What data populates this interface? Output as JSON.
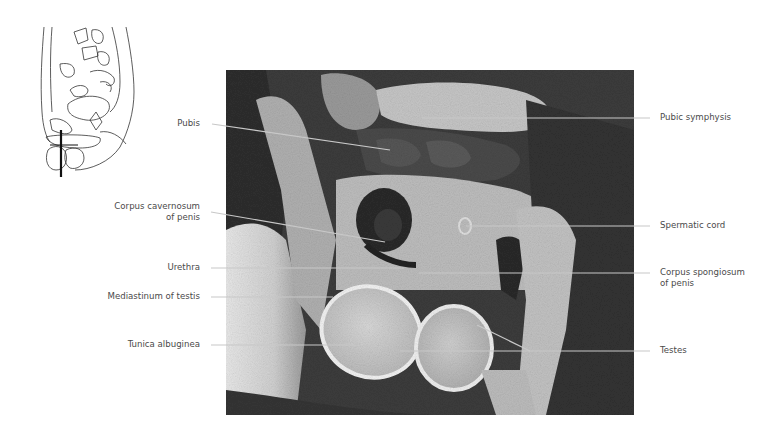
{
  "figure": {
    "orientation_diagram": {
      "description": "Sagittal pelvis sketch with coronal slice line"
    },
    "image": {
      "type": "MRI coronal section",
      "region": "male pelvis / scrotum"
    },
    "labels_left": [
      {
        "id": "pubis",
        "text": "Pubis"
      },
      {
        "id": "corpus-cavernosum",
        "text": "Corpus cavernosum",
        "text2": "of penis"
      },
      {
        "id": "urethra",
        "text": "Urethra"
      },
      {
        "id": "mediastinum-testis",
        "text": "Mediastinum of testis"
      },
      {
        "id": "tunica-albuginea",
        "text": "Tunica albuginea"
      }
    ],
    "labels_right": [
      {
        "id": "pubic-symphysis",
        "text": "Pubic symphysis"
      },
      {
        "id": "spermatic-cord",
        "text": "Spermatic cord"
      },
      {
        "id": "corpus-spongiosum",
        "text": "Corpus spongiosum",
        "text2": "of penis"
      },
      {
        "id": "testes",
        "text": "Testes"
      }
    ],
    "colors": {
      "leader_line": "#c8c8c8",
      "label_text": "#4a4a4a",
      "background": "#ffffff"
    }
  }
}
